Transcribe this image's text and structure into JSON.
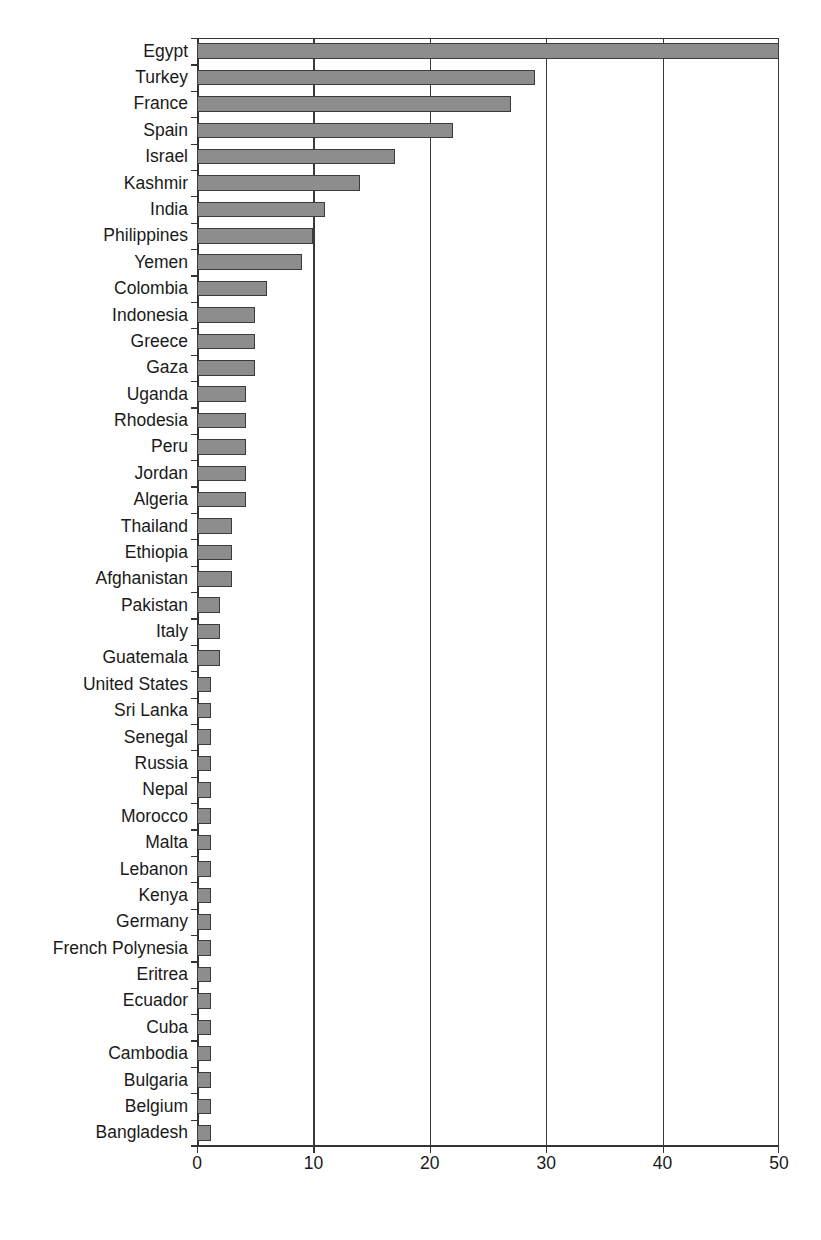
{
  "chart_data": {
    "type": "bar",
    "orientation": "horizontal",
    "title": "",
    "subtitle": "",
    "xlabel": "",
    "ylabel": "",
    "xlim": [
      0,
      50
    ],
    "xticks": [
      0,
      10,
      20,
      30,
      40,
      50
    ],
    "xtick_labels": [
      "0",
      "10",
      "20",
      "30",
      "40",
      "50"
    ],
    "grid": "vertical",
    "legend": "none",
    "bar_color": "#8d8d8d",
    "bar_edge_color": "#3b3b3b",
    "axis_color": "#333333",
    "background_color": "#ffffff",
    "categories": [
      "Egypt",
      "Turkey",
      "France",
      "Spain",
      "Israel",
      "Kashmir",
      "India",
      "Philippines",
      "Yemen",
      "Colombia",
      "Indonesia",
      "Greece",
      "Gaza",
      "Uganda",
      "Rhodesia",
      "Peru",
      "Jordan",
      "Algeria",
      "Thailand",
      "Ethiopia",
      "Afghanistan",
      "Pakistan",
      "Italy",
      "Guatemala",
      "United States",
      "Sri Lanka",
      "Senegal",
      "Russia",
      "Nepal",
      "Morocco",
      "Malta",
      "Lebanon",
      "Kenya",
      "Germany",
      "French Polynesia",
      "Eritrea",
      "Ecuador",
      "Cuba",
      "Cambodia",
      "Bulgaria",
      "Belgium",
      "Bangladesh"
    ],
    "values": [
      50,
      29,
      27,
      22,
      17,
      14,
      11,
      10,
      9,
      6,
      5,
      5,
      5,
      4.2,
      4.2,
      4.2,
      4.2,
      4.2,
      3,
      3,
      3,
      2,
      2,
      2,
      1.2,
      1.2,
      1.2,
      1.2,
      1.2,
      1.2,
      1.2,
      1.2,
      1.2,
      1.2,
      1.2,
      1.2,
      1.2,
      1.2,
      1.2,
      1.2,
      1.2,
      1.2
    ]
  }
}
